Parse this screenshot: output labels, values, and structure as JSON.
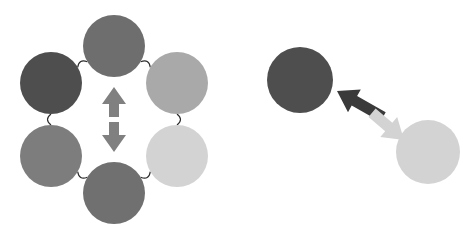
{
  "figure": {
    "background_color": "#ffffff",
    "width": 463,
    "height": 240
  },
  "panels": [
    {
      "id": "left-panel",
      "name": "hexagonal-ring-panel",
      "description": "Six shaded circles arranged in a hexagonal ring joined by thin curved links, with a vertical double-headed arrow at the centre",
      "center": {
        "x": 114,
        "y": 119
      },
      "ring_radius": 73,
      "node_radius": 31,
      "link_color": "#2b2b2b",
      "link_width": 1.15,
      "nodes": [
        {
          "id": "node-top",
          "label": "top node",
          "cx": 114,
          "cy": 46,
          "r": 31,
          "color": "#6e6e6e",
          "angle_deg": 270
        },
        {
          "id": "node-upper-right",
          "label": "upper right node",
          "cx": 177,
          "cy": 83,
          "r": 31,
          "color": "#a9a9a9",
          "angle_deg": 330
        },
        {
          "id": "node-lower-right",
          "label": "lower right node",
          "cx": 177,
          "cy": 156,
          "r": 31,
          "color": "#d3d3d3",
          "angle_deg": 30
        },
        {
          "id": "node-bottom",
          "label": "bottom node",
          "cx": 114,
          "cy": 193,
          "r": 31,
          "color": "#707070",
          "angle_deg": 90
        },
        {
          "id": "node-lower-left",
          "label": "lower left node",
          "cx": 51,
          "cy": 156,
          "r": 31,
          "color": "#7d7d7d",
          "angle_deg": 150
        },
        {
          "id": "node-upper-left",
          "label": "upper left node",
          "cx": 51,
          "cy": 83,
          "r": 31,
          "color": "#4e4e4e",
          "angle_deg": 210
        }
      ],
      "links": [
        {
          "from": "node-top",
          "to": "node-upper-right"
        },
        {
          "from": "node-upper-right",
          "to": "node-lower-right"
        },
        {
          "from": "node-lower-right",
          "to": "node-bottom"
        },
        {
          "from": "node-bottom",
          "to": "node-lower-left"
        },
        {
          "from": "node-lower-left",
          "to": "node-upper-left"
        },
        {
          "from": "node-upper-left",
          "to": "node-top"
        }
      ],
      "center_arrow": {
        "id": "center-double-arrow",
        "label": "vertical bidirectional arrow",
        "orientation": "vertical",
        "color": "#808080",
        "x": 114,
        "top_y": 87,
        "bottom_y": 152,
        "shaft_width": 10,
        "head_width": 24,
        "head_length": 17,
        "gap_height": 5,
        "gap_color": "#ffffff"
      }
    },
    {
      "id": "right-panel",
      "name": "node-pair-panel",
      "description": "A dark circle and a light circle joined by a diagonal two-tone double-headed arrow",
      "nodes": [
        {
          "id": "pair-node-dark",
          "label": "dark node",
          "cx": 300,
          "cy": 80,
          "r": 33,
          "color": "#4e4e4e"
        },
        {
          "id": "pair-node-light",
          "label": "light node",
          "cx": 428,
          "cy": 152,
          "r": 32,
          "color": "#d3d3d3"
        }
      ],
      "arrow": {
        "id": "pair-double-arrow",
        "label": "diagonal bidirectional arrow",
        "orientation": "diagonal",
        "angle_deg": 29,
        "dark_half_color": "#3a3a3a",
        "light_half_color": "#d3d3d3",
        "tail_x": 383,
        "tail_y": 117,
        "head_dark_x": 337,
        "head_dark_y": 91,
        "head_light_x": 404,
        "head_light_y": 140,
        "shaft_width": 11,
        "head_width": 26,
        "head_length": 20
      }
    }
  ],
  "palette": {
    "darkest": "#4e4e4e",
    "dark": "#3a3a3a",
    "mid_dark": "#6e6e6e",
    "mid": "#707070",
    "mid_light": "#7d7d7d",
    "light": "#a9a9a9",
    "lightest": "#d3d3d3",
    "arrow_gray": "#808080",
    "link": "#2b2b2b",
    "background": "#ffffff"
  }
}
